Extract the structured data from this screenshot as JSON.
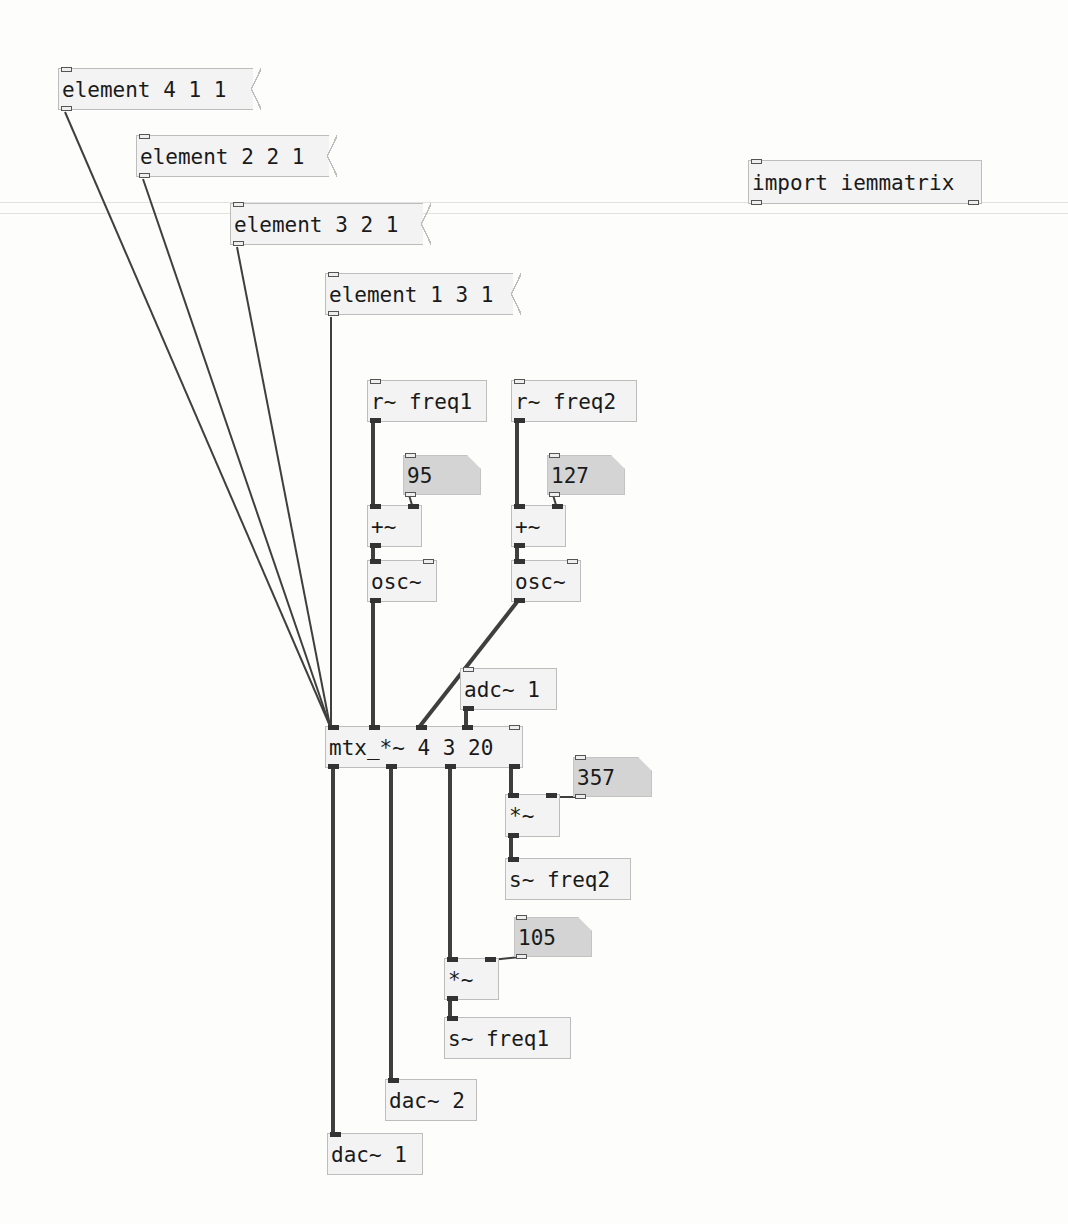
{
  "canvas": {
    "type": "Pure Data patch",
    "background": "#fdfdfc",
    "box_fill": "#f3f3f3",
    "number_fill": "#d4d4d4",
    "wire_color": "#444444"
  },
  "messages": [
    {
      "id": "msg_e411",
      "text": "element 4 1 1"
    },
    {
      "id": "msg_e221",
      "text": "element 2 2 1"
    },
    {
      "id": "msg_e321",
      "text": "element 3 2 1"
    },
    {
      "id": "msg_e131",
      "text": "element 1 3 1"
    }
  ],
  "objects": {
    "import": "import iemmatrix",
    "recv_freq1": "r~ freq1",
    "recv_freq2": "r~ freq2",
    "add1": "+~",
    "add2": "+~",
    "osc1": "osc~",
    "osc2": "osc~",
    "adc": "adc~ 1",
    "mtx": "mtx_*~ 4 3 20",
    "mul_a": "*~",
    "send_freq2": "s~ freq2",
    "mul_b": "*~",
    "send_freq1": "s~ freq1",
    "dac2": "dac~ 2",
    "dac1": "dac~ 1"
  },
  "numbers": {
    "n95": "95",
    "n127": "127",
    "n357": "357",
    "n105": "105"
  }
}
